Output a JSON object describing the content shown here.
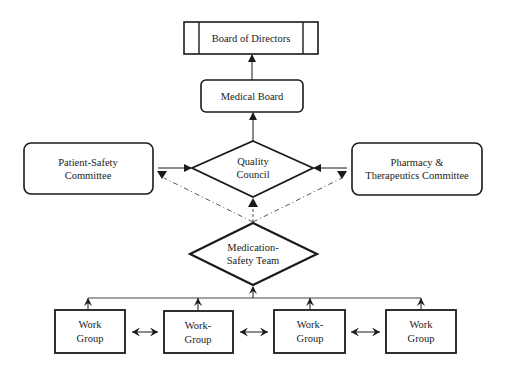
{
  "diagram": {
    "type": "organizational-flowchart",
    "colors": {
      "stroke": "#1a1a1a",
      "background": "#ffffff",
      "text": "#1a1a1a"
    },
    "nodes": {
      "board_of_directors": {
        "label": "Board of Directors",
        "shape": "process-box"
      },
      "medical_board": {
        "label": "Medical Board",
        "shape": "rounded-rect"
      },
      "patient_safety": {
        "line1": "Patient-Safety",
        "line2": "Committee",
        "shape": "rounded-rect"
      },
      "quality_council": {
        "line1": "Quality",
        "line2": "Council",
        "shape": "diamond"
      },
      "pharmacy": {
        "line1": "Pharmacy &",
        "line2": "Therapeutics Committee",
        "shape": "rounded-rect"
      },
      "medication_safety": {
        "line1": "Medication-",
        "line2": "Safety Team",
        "shape": "diamond"
      },
      "work_groups": [
        {
          "line1": "Work",
          "line2": "Group"
        },
        {
          "line1": "Work-",
          "line2": "Group"
        },
        {
          "line1": "Work-",
          "line2": "Group"
        },
        {
          "line1": "Work",
          "line2": "Group"
        }
      ]
    },
    "edges": [
      {
        "from": "Medical Board",
        "to": "Board of Directors",
        "style": "solid"
      },
      {
        "from": "Quality Council",
        "to": "Medical Board",
        "style": "solid"
      },
      {
        "from": "Patient-Safety Committee",
        "to": "Quality Council",
        "style": "solid"
      },
      {
        "from": "Pharmacy & Therapeutics Committee",
        "to": "Quality Council",
        "style": "solid"
      },
      {
        "from": "Medication-Safety Team",
        "to": "Quality Council",
        "style": "dash-dot"
      },
      {
        "from": "Medication-Safety Team",
        "to": "Patient-Safety Committee",
        "style": "dash-dot"
      },
      {
        "from": "Medication-Safety Team",
        "to": "Pharmacy & Therapeutics Committee",
        "style": "dash-dot"
      },
      {
        "from": "Work Groups",
        "to": "Medication-Safety Team",
        "style": "solid"
      },
      {
        "between": "Work Group 1",
        "and": "Work Group 2",
        "style": "bidirectional"
      },
      {
        "between": "Work Group 2",
        "and": "Work Group 3",
        "style": "bidirectional"
      },
      {
        "between": "Work Group 3",
        "and": "Work Group 4",
        "style": "bidirectional"
      }
    ]
  }
}
